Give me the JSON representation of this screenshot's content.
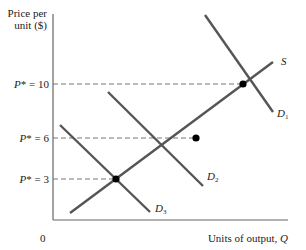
{
  "diagram": {
    "type": "supply-demand",
    "y_axis_label_line1": "Price per",
    "y_axis_label_line2": "unit ($)",
    "x_axis_label": "Units of output, ",
    "x_axis_var": "Q",
    "origin_label": "0",
    "price_ticks": [
      {
        "prefix": "P",
        "text": "* = 10",
        "value": 10
      },
      {
        "prefix": "P",
        "text": "* = 6",
        "value": 6
      },
      {
        "prefix": "P",
        "text": "* = 3",
        "value": 3
      }
    ],
    "curves": {
      "supply": {
        "label": "S"
      },
      "demand": [
        {
          "label": "D",
          "sub": "1"
        },
        {
          "label": "D",
          "sub": "2"
        },
        {
          "label": "D",
          "sub": "3"
        }
      ]
    },
    "equilibria": [
      {
        "price": 10,
        "demand": "D1"
      },
      {
        "price": 6,
        "demand": "D2"
      },
      {
        "price": 3,
        "demand": "D3"
      }
    ],
    "colors": {
      "line": "#555555",
      "axis": "#666666",
      "point": "#000000",
      "text": "#222222"
    }
  }
}
